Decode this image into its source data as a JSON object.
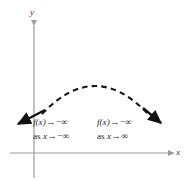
{
  "figure": {
    "type": "end-behavior-graph",
    "background_color": "#ffffff",
    "axes": {
      "x_label": "x",
      "y_label": "y",
      "axis_color": "#9a9a9e",
      "x_axis_y": 153,
      "y_axis_x": 34
    },
    "curve": {
      "style": "dashed-middle-solid-ends",
      "color": "#1a1a1a",
      "shape": "downward-opening-parabola",
      "peak_x": 95,
      "peak_y": 78,
      "left_arrow_tip": "15,126",
      "right_arrow_tip": "164,126"
    },
    "annotations": {
      "left": {
        "line1_fn": "f(x)",
        "line1_arrow": "→",
        "line1_limit": "−∞",
        "line2_prefix": "as",
        "line2_var": "x",
        "line2_arrow": "→",
        "line2_limit": "−∞",
        "line1_full": "f(x) → −∞",
        "line2_full": "as x→ −∞"
      },
      "right": {
        "line1_fn": "f(x)",
        "line1_arrow": "→",
        "line1_limit": "−∞",
        "line2_prefix": "as",
        "line2_var": "x",
        "line2_arrow": "→",
        "line2_limit": "∞",
        "line1_full": "f(x) → −∞",
        "line2_full": "as x→ ∞"
      }
    }
  }
}
